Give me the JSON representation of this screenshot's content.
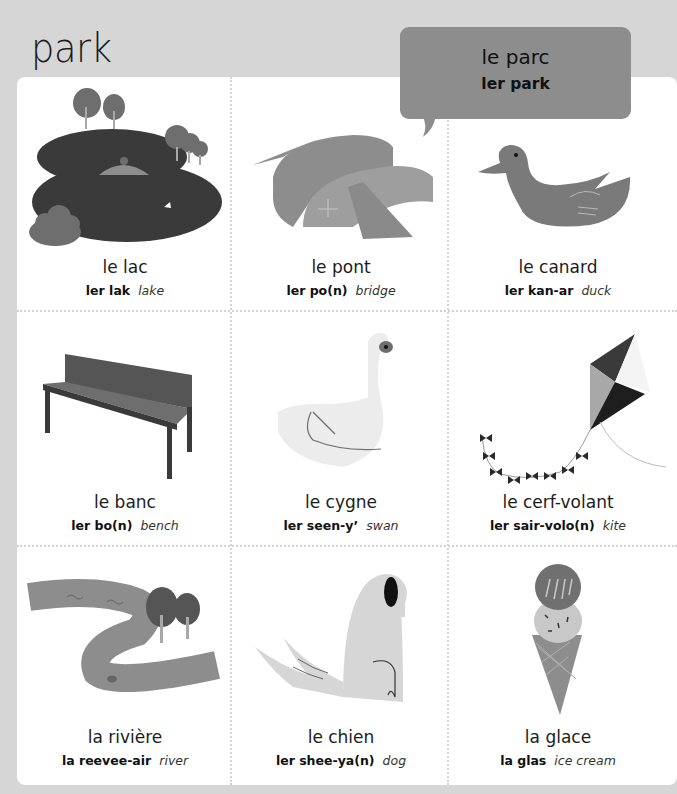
{
  "page": {
    "title": "park"
  },
  "bubble": {
    "french": "le parc",
    "pronunciation": "ler park",
    "color": "#8d8d8d"
  },
  "colors": {
    "background": "#d6d6d6",
    "card": "#ffffff",
    "dark": "#3a3a3a",
    "mid": "#6e6e6e",
    "light": "#a8a8a8"
  },
  "items": [
    {
      "french": "le lac",
      "pronunciation": "ler lak",
      "english": "lake",
      "icon": "lake-icon"
    },
    {
      "french": "le pont",
      "pronunciation": "ler po(n)",
      "english": "bridge",
      "icon": "bridge-icon"
    },
    {
      "french": "le canard",
      "pronunciation": "ler kan-ar",
      "english": "duck",
      "icon": "duck-icon"
    },
    {
      "french": "le banc",
      "pronunciation": "ler bo(n)",
      "english": "bench",
      "icon": "bench-icon"
    },
    {
      "french": "le cygne",
      "pronunciation": "ler seen-y’",
      "english": "swan",
      "icon": "swan-icon"
    },
    {
      "french": "le cerf-volant",
      "pronunciation": "ler sair-volo(n)",
      "english": "kite",
      "icon": "kite-icon"
    },
    {
      "french": "la rivière",
      "pronunciation": "la reevee-air",
      "english": "river",
      "icon": "river-icon"
    },
    {
      "french": "le chien",
      "pronunciation": "ler shee-ya(n)",
      "english": "dog",
      "icon": "dog-icon"
    },
    {
      "french": "la glace",
      "pronunciation": "la glas",
      "english": "ice cream",
      "icon": "ice-cream-icon"
    }
  ]
}
